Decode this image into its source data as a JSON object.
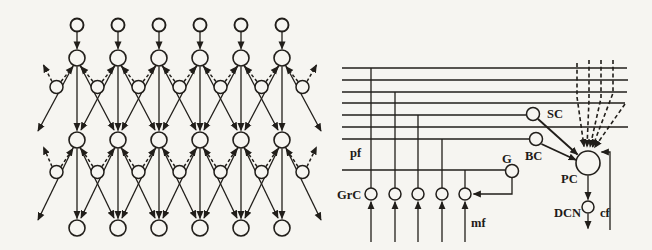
{
  "figure": {
    "ink_color": "#211e1a",
    "background_color": "#f6f5f1"
  },
  "left_network": {
    "columns": [
      77,
      118,
      159,
      200,
      241,
      282
    ],
    "interneuron_x": [
      56.5,
      97.5,
      138.5,
      179.5,
      220.5,
      261.5,
      302.5
    ],
    "row_y": {
      "input": 25,
      "upper": 58,
      "upper_inter": 87,
      "lower": 140,
      "lower_inter": 172,
      "output": 228
    },
    "r": {
      "input": 6.5,
      "main": 8,
      "inter": 6.5
    },
    "edge": {
      "left_x": 38,
      "right_x": 321,
      "upper_y": 131,
      "lower_y": 220,
      "dash_left_x": 43.5,
      "dash_right_x": 316.5
    }
  },
  "right_circuit": {
    "pf_x1": 342,
    "pf_lines": [
      {
        "y": 68,
        "x2": 627
      },
      {
        "y": 80,
        "x2": 628
      },
      {
        "y": 92,
        "x2": 627
      },
      {
        "y": 103,
        "x2": 625
      },
      {
        "y": 115,
        "x2": 526
      },
      {
        "y": 127,
        "x2": 628
      },
      {
        "y": 139,
        "x2": 529
      },
      {
        "y": 170,
        "x2": 505
      }
    ],
    "grc": {
      "y": 194,
      "r": 6,
      "cells": [
        {
          "x": 371,
          "pf": 0
        },
        {
          "x": 395,
          "pf": 2
        },
        {
          "x": 418,
          "pf": 4
        },
        {
          "x": 442,
          "pf": 6
        },
        {
          "x": 465,
          "pf": 7
        }
      ]
    },
    "mf_bottom_y": 242,
    "cells": {
      "SC": {
        "cx": 533,
        "cy": 114,
        "r": 6.5
      },
      "BC": {
        "cx": 536,
        "cy": 139,
        "r": 6.5
      },
      "G": {
        "cx": 512,
        "cy": 171,
        "r": 6.5
      },
      "PC": {
        "cx": 588,
        "cy": 163,
        "r": 12
      },
      "DCN": {
        "cx": 588,
        "cy": 207,
        "r": 6
      }
    },
    "arrows": {
      "sc_pc": [
        [
          538,
          119
        ],
        [
          577.5,
          154.5
        ]
      ],
      "bc_pc": [
        [
          541.5,
          144
        ],
        [
          576,
          160
        ]
      ],
      "pc_dcn": [
        [
          588,
          175.5
        ],
        [
          588,
          199.5
        ]
      ],
      "dcn_out": [
        [
          588,
          213.5
        ],
        [
          588,
          228.5
        ]
      ],
      "g_grc": [
        [
          512,
          178
        ],
        [
          512,
          194
        ],
        [
          473.5,
          194
        ]
      ],
      "cf_line": [
        [
          610,
          230
        ],
        [
          610,
          152
        ],
        [
          601.5,
          152
        ]
      ]
    },
    "dashed_cf_branches": [
      [
        [
          577,
          63
        ],
        [
          577,
          97
        ],
        [
          584,
          146.5
        ]
      ],
      [
        [
          589,
          60
        ],
        [
          589,
          100
        ],
        [
          587,
          147
        ]
      ],
      [
        [
          601,
          60
        ],
        [
          601,
          98
        ],
        [
          590,
          147
        ]
      ],
      [
        [
          613,
          60
        ],
        [
          613,
          93
        ],
        [
          592.5,
          147
        ]
      ],
      [
        [
          625,
          104
        ],
        [
          594.5,
          147.5
        ]
      ]
    ],
    "labels": [
      {
        "id": "pf",
        "text": "pf",
        "x": 350,
        "y": 157,
        "size": 12.5
      },
      {
        "id": "GrC",
        "text": "GrC",
        "x": 337,
        "y": 199,
        "size": 12.5
      },
      {
        "id": "mf",
        "text": "mf",
        "x": 471,
        "y": 227,
        "size": 12.5
      },
      {
        "id": "G",
        "text": "G",
        "x": 502,
        "y": 163,
        "size": 12.5
      },
      {
        "id": "BC",
        "text": "BC",
        "x": 525,
        "y": 160,
        "size": 12.5
      },
      {
        "id": "SC",
        "text": "SC",
        "x": 547,
        "y": 118,
        "size": 12.5
      },
      {
        "id": "PC",
        "text": "PC",
        "x": 561,
        "y": 183,
        "size": 12.5
      },
      {
        "id": "DCN",
        "text": "DCN",
        "x": 554,
        "y": 217,
        "size": 12.5
      },
      {
        "id": "cf",
        "text": "cf",
        "x": 600,
        "y": 217,
        "size": 12.5
      }
    ]
  }
}
